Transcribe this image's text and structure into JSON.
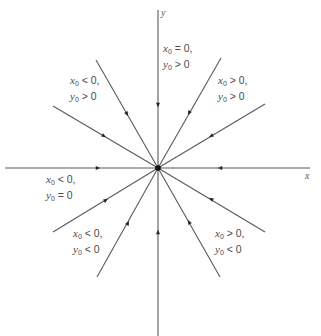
{
  "diagram": {
    "type": "phase-portrait",
    "origin": {
      "x": 158,
      "y": 168
    },
    "axes": {
      "x_label": "x",
      "y_label": "y"
    },
    "colors": {
      "line": "#5a5a5a",
      "text": "#4a4a4a",
      "node": "#111111"
    },
    "rays": [
      {
        "name": "positive-y-axis",
        "end": [
          158,
          10
        ],
        "arrow_at": [
          158,
          105
        ]
      },
      {
        "name": "negative-y-axis",
        "end": [
          158,
          336
        ],
        "arrow_at": [
          158,
          232
        ]
      },
      {
        "name": "negative-x-axis",
        "end": [
          5,
          168
        ],
        "arrow_at": [
          98,
          168
        ]
      },
      {
        "name": "positive-x-axis",
        "end": [
          310,
          168
        ],
        "arrow_at": [
          220,
          168
        ]
      },
      {
        "name": "upper-left-steep",
        "end": [
          96,
          60
        ],
        "arrow_at": [
          127,
          114
        ]
      },
      {
        "name": "upper-left-shallow",
        "end": [
          53,
          106
        ],
        "arrow_at": [
          104,
          136
        ]
      },
      {
        "name": "upper-right-steep",
        "end": [
          221,
          58
        ],
        "arrow_at": [
          189,
          113
        ]
      },
      {
        "name": "upper-right-shallow",
        "end": [
          265,
          104
        ],
        "arrow_at": [
          211,
          136
        ]
      },
      {
        "name": "lower-left-shallow",
        "end": [
          53,
          232
        ],
        "arrow_at": [
          106,
          200
        ]
      },
      {
        "name": "lower-left-steep",
        "end": [
          97,
          277
        ],
        "arrow_at": [
          128,
          223
        ]
      },
      {
        "name": "lower-right-shallow",
        "end": [
          265,
          232
        ],
        "arrow_at": [
          211,
          199
        ]
      },
      {
        "name": "lower-right-steep",
        "end": [
          220,
          277
        ],
        "arrow_at": [
          189,
          222
        ]
      }
    ],
    "region_labels": [
      {
        "id": "x0-eq-0-y0-gt-0",
        "line1": {
          "var": "x",
          "sub": "0",
          "rel": " = 0,"
        },
        "line2": {
          "var": "y",
          "sub": "0",
          "rel": " > 0"
        },
        "left": 163,
        "top": 42
      },
      {
        "id": "x0-lt-0-y0-gt-0",
        "line1": {
          "var": "x",
          "sub": "0",
          "rel": " < 0,"
        },
        "line2": {
          "var": "y",
          "sub": "0",
          "rel": " > 0"
        },
        "left": 70,
        "top": 74
      },
      {
        "id": "x0-gt-0-y0-gt-0",
        "line1": {
          "var": "x",
          "sub": "0",
          "rel": " > 0,"
        },
        "line2": {
          "var": "y",
          "sub": "0",
          "rel": " > 0"
        },
        "left": 218,
        "top": 74
      },
      {
        "id": "x0-lt-0-y0-eq-0",
        "line1": {
          "var": "x",
          "sub": "0",
          "rel": " < 0,"
        },
        "line2": {
          "var": "y",
          "sub": "0",
          "rel": " = 0"
        },
        "left": 46,
        "top": 173
      },
      {
        "id": "x0-lt-0-y0-lt-0",
        "line1": {
          "var": "x",
          "sub": "0",
          "rel": " < 0,"
        },
        "line2": {
          "var": "y",
          "sub": "0",
          "rel": " < 0"
        },
        "left": 73,
        "top": 227
      },
      {
        "id": "x0-gt-0-y0-lt-0",
        "line1": {
          "var": "x",
          "sub": "0",
          "rel": " > 0,"
        },
        "line2": {
          "var": "y",
          "sub": "0",
          "rel": " < 0"
        },
        "left": 215,
        "top": 227
      }
    ]
  }
}
